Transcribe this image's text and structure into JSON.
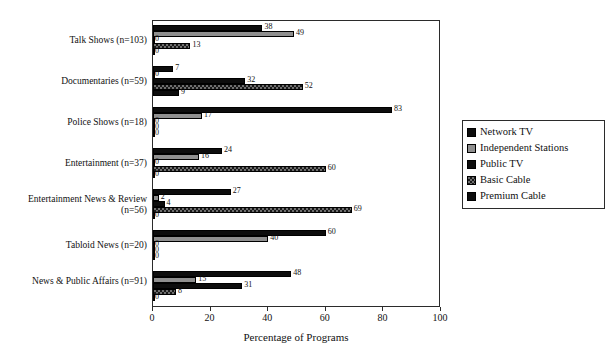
{
  "chart_data": {
    "type": "bar",
    "orientation": "horizontal",
    "title": "",
    "xlabel": "Percentage of Programs",
    "ylabel": "Genre",
    "xlim": [
      0,
      100
    ],
    "xticks": [
      0,
      20,
      40,
      60,
      80,
      100
    ],
    "grid": false,
    "legend_position": "right",
    "categories": [
      "Talk Shows (n=103)",
      "Documentaries (n=59)",
      "Police Shows (n=18)",
      "Entertainment (n=37)",
      "Entertainment News & Review (n=56)",
      "Tabloid News (n=20)",
      "News & Public Affairs (n=91)"
    ],
    "series": [
      {
        "name": "Network TV",
        "values": [
          38,
          7,
          83,
          24,
          27,
          60,
          48
        ]
      },
      {
        "name": "Independent Stations",
        "values": [
          49,
          0,
          17,
          16,
          2,
          40,
          15
        ]
      },
      {
        "name": "Public TV",
        "values": [
          0,
          32,
          0,
          0,
          4,
          0,
          31
        ]
      },
      {
        "name": "Basic Cable",
        "values": [
          13,
          52,
          0,
          60,
          69,
          0,
          8
        ]
      },
      {
        "name": "Premium Cable",
        "values": [
          0,
          9,
          0,
          0,
          0,
          0,
          0
        ]
      }
    ]
  },
  "axes": {
    "x_title": "Percentage of Programs",
    "y_title": "Genre",
    "x_tick_labels": [
      "0",
      "20",
      "40",
      "60",
      "80",
      "100"
    ]
  },
  "legend": {
    "items": [
      {
        "label": "Network TV",
        "swatch": "network",
        "color": "#0d0d0d"
      },
      {
        "label": "Independent Stations",
        "swatch": "indep",
        "color": "#8f8f8f"
      },
      {
        "label": "Public TV",
        "swatch": "public",
        "color": "#0d0d0d"
      },
      {
        "label": "Basic Cable",
        "swatch": "basic",
        "color": "#6f6f6f"
      },
      {
        "label": "Premium Cable",
        "swatch": "premium",
        "color": "#0d0d0d"
      }
    ]
  }
}
